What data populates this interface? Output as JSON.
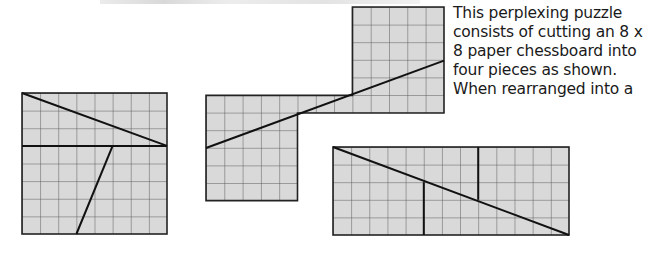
{
  "caption": {
    "lines": [
      "This perplexing puzzle",
      "consists of cutting an 8 x",
      "8 paper chessboard into",
      "four pieces as shown.",
      "When rearranged into a"
    ]
  },
  "colors": {
    "fill": "#d9d9d9",
    "grid": "#555555",
    "cut": "#111111"
  },
  "figures": [
    {
      "name": "original-chessboard",
      "grid": "8x8",
      "cuts": [
        "(0,0)-(8,3)",
        "(0,3)-(8,3)",
        "(5,3)-(3,8)"
      ]
    },
    {
      "name": "rearranged-staircase",
      "cuts": [
        "diagonal 13x5"
      ]
    },
    {
      "name": "rearranged-rectangle",
      "grid": "13x5",
      "cuts": [
        "(0,0)-(13,5)",
        "(5,2)-(5,5)",
        "(8,0)-(8,3)"
      ]
    }
  ]
}
